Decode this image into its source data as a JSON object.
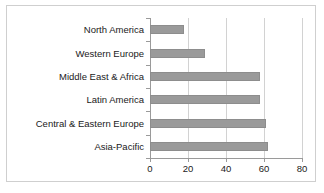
{
  "chart_data": {
    "type": "bar",
    "orientation": "horizontal",
    "title": "",
    "xlabel": "",
    "ylabel": "",
    "xlim": [
      0,
      80
    ],
    "xticks": [
      0,
      20,
      40,
      60,
      80
    ],
    "grid": true,
    "legend": false,
    "bar_color": "#9a9a9a",
    "categories": [
      "North America",
      "Western Europe",
      "Middle East & Africa",
      "Latin America",
      "Central & Eastern Europe",
      "Asia-Pacific"
    ],
    "values": [
      18,
      29,
      58,
      58,
      61,
      62
    ]
  }
}
